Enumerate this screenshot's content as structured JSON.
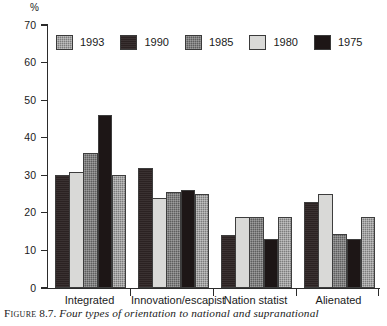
{
  "figure": {
    "caption_label": "Figure",
    "caption_number": "8.7.",
    "caption_text": "Four types of orientation to national and supranational"
  },
  "axis": {
    "y_unit": "%",
    "y_ticks": [
      "70",
      "60",
      "50",
      "40",
      "30",
      "20",
      "10",
      "0"
    ]
  },
  "legend": {
    "items": [
      {
        "label": "1993",
        "color": "#7c7c7c",
        "style": "fill-1993"
      },
      {
        "label": "1990",
        "color": "#2b2222",
        "style": "fill-1990"
      },
      {
        "label": "1985",
        "color": "#5e5e5e",
        "style": "fill-1985"
      },
      {
        "label": "1980",
        "color": "#d9d9d7",
        "style": "fill-1980"
      },
      {
        "label": "1975",
        "color": "#1d1616",
        "style": "fill-1975"
      }
    ]
  },
  "chart_data": {
    "type": "bar",
    "title": "",
    "xlabel": "",
    "ylabel": "%",
    "ylim": [
      0,
      70
    ],
    "ytick_step": 10,
    "grid": false,
    "legend_position": "top-inside",
    "categories": [
      "Integrated",
      "Innovation/escapist",
      "Nation statist",
      "Alienated"
    ],
    "series": [
      {
        "name": "1993",
        "values": [
          30.0,
          25.0,
          19.0,
          19.0
        ]
      },
      {
        "name": "1990",
        "values": [
          30.0,
          32.0,
          14.0,
          23.0
        ]
      },
      {
        "name": "1985",
        "values": [
          36.0,
          25.5,
          19.0,
          14.5
        ]
      },
      {
        "name": "1980",
        "values": [
          30.8,
          24.0,
          19.0,
          25.0
        ]
      },
      {
        "name": "1975",
        "values": [
          46.0,
          26.0,
          13.0,
          13.0
        ]
      }
    ],
    "bar_draw_order": [
      "1990",
      "1980",
      "1985",
      "1975",
      "1993"
    ]
  }
}
